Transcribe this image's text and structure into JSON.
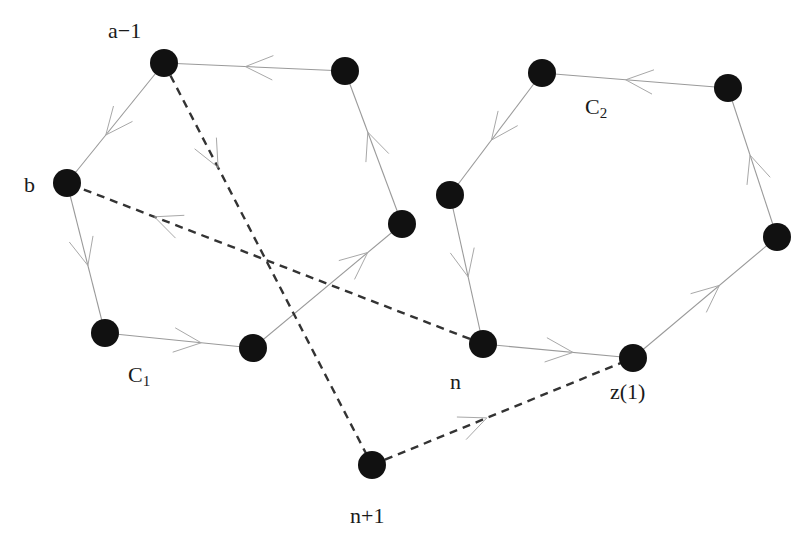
{
  "colors": {
    "background": "#ffffff",
    "node": "#111111",
    "solid_edge": "#9a9a9a",
    "dashed_edge": "#333333",
    "text": "#1a1a1a"
  },
  "node_radius": 14,
  "nodes": [
    {
      "id": "a_minus_1",
      "x": 164,
      "y": 63,
      "label": "a−1",
      "label_x": 108,
      "label_y": 20
    },
    {
      "id": "c1_top_right",
      "x": 345,
      "y": 71,
      "label": ""
    },
    {
      "id": "b",
      "x": 67,
      "y": 183,
      "label": "b",
      "label_x": 24,
      "label_y": 174
    },
    {
      "id": "c1_right",
      "x": 402,
      "y": 224,
      "label": ""
    },
    {
      "id": "c1_bottom_left",
      "x": 105,
      "y": 333,
      "label": ""
    },
    {
      "id": "c1_bottom",
      "x": 253,
      "y": 348,
      "label": ""
    },
    {
      "id": "n_plus_1",
      "x": 372,
      "y": 465,
      "label": "n+1",
      "label_x": 350,
      "label_y": 505
    },
    {
      "id": "n",
      "x": 483,
      "y": 344,
      "label": "n",
      "label_x": 450,
      "label_y": 371
    },
    {
      "id": "z1",
      "x": 633,
      "y": 358,
      "label": "z(1)",
      "label_x": 610,
      "label_y": 381
    },
    {
      "id": "c2_top_left",
      "x": 542,
      "y": 73,
      "label": ""
    },
    {
      "id": "c2_top_right",
      "x": 728,
      "y": 88,
      "label": ""
    },
    {
      "id": "c2_left",
      "x": 450,
      "y": 195,
      "label": ""
    },
    {
      "id": "c2_right",
      "x": 777,
      "y": 237,
      "label": ""
    }
  ],
  "cycle_labels": [
    {
      "id": "C1",
      "text": "C",
      "sub": "1",
      "x": 128,
      "y": 364
    },
    {
      "id": "C2",
      "text": "C",
      "sub": "2",
      "x": 585,
      "y": 96
    }
  ],
  "edges": [
    {
      "from": "c1_top_right",
      "to": "a_minus_1",
      "style": "solid",
      "arrow_t": 0.55
    },
    {
      "from": "a_minus_1",
      "to": "b",
      "style": "solid",
      "arrow_t": 0.6
    },
    {
      "from": "b",
      "to": "c1_bottom_left",
      "style": "solid",
      "arrow_t": 0.55
    },
    {
      "from": "c1_bottom_left",
      "to": "c1_bottom",
      "style": "solid",
      "arrow_t": 0.65
    },
    {
      "from": "c1_bottom",
      "to": "c1_right",
      "style": "solid",
      "arrow_t": 0.77
    },
    {
      "from": "c1_right",
      "to": "c1_top_right",
      "style": "solid",
      "arrow_t": 0.6
    },
    {
      "from": "c2_top_right",
      "to": "c2_top_left",
      "style": "solid",
      "arrow_t": 0.55
    },
    {
      "from": "c2_top_left",
      "to": "c2_left",
      "style": "solid",
      "arrow_t": 0.55
    },
    {
      "from": "c2_left",
      "to": "n",
      "style": "solid",
      "arrow_t": 0.55
    },
    {
      "from": "n",
      "to": "z1",
      "style": "solid",
      "arrow_t": 0.6
    },
    {
      "from": "z1",
      "to": "c2_right",
      "style": "solid",
      "arrow_t": 0.6
    },
    {
      "from": "c2_right",
      "to": "c2_top_right",
      "style": "solid",
      "arrow_t": 0.55
    },
    {
      "from": "a_minus_1",
      "to": "n_plus_1",
      "style": "dashed",
      "arrow_t": 0.26
    },
    {
      "from": "n",
      "to": "b",
      "style": "dashed",
      "arrow_t": 0.79
    },
    {
      "from": "n_plus_1",
      "to": "z1",
      "style": "dashed",
      "arrow_t": 0.44
    }
  ]
}
